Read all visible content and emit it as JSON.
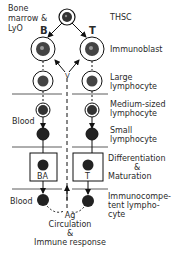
{
  "left_labels": {
    "origin": [
      "Bone",
      "marrow &",
      "LyO"
    ],
    "blood_1": "Blood",
    "blood_2": "Blood"
  },
  "branch_labels": {
    "b": "B",
    "t": "T",
    "v": "V",
    "ba": "BA",
    "t_box": "T"
  },
  "stages": [
    {
      "label": "THSC"
    },
    {
      "label": "Immunoblast"
    },
    {
      "label": "Large",
      "label2": "lymphocyte"
    },
    {
      "label": "Medium-sized",
      "label2": "lymphocyte"
    },
    {
      "label": "Small",
      "label2": "lymphocyte"
    },
    {
      "label": "Differentiation",
      "label2": "&",
      "label3": "Maturation"
    },
    {
      "label": "Immunocompe-",
      "label2": "tent lympho-",
      "label3": "cyte"
    }
  ],
  "bottom": {
    "ag": "Ag",
    "line1": "Circulation",
    "line2": "&",
    "line3": "Immune response"
  }
}
